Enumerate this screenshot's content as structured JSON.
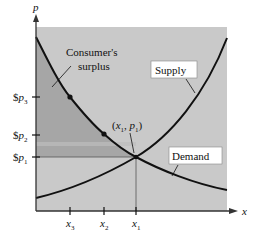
{
  "diagram": {
    "type": "economics supply-demand",
    "axes": {
      "y_label": "p",
      "x_label": "x"
    },
    "y_ticks": [
      {
        "id": "p3",
        "prefix": "$",
        "var": "p",
        "sub": "3",
        "y": 97
      },
      {
        "id": "p2",
        "prefix": "$",
        "var": "p",
        "sub": "2",
        "y": 135
      },
      {
        "id": "p1",
        "prefix": "$",
        "var": "p",
        "sub": "1",
        "y": 157
      }
    ],
    "x_ticks": [
      {
        "id": "x3",
        "var": "x",
        "sub": "3",
        "x": 70
      },
      {
        "id": "x2",
        "var": "x",
        "sub": "2",
        "x": 104
      },
      {
        "id": "x1",
        "var": "x",
        "sub": "1",
        "x": 136
      }
    ],
    "curves": {
      "supply_label": "Supply",
      "demand_label": "Demand"
    },
    "annotations": {
      "consumer_surplus_line1": "Consumer's",
      "consumer_surplus_line2": "surplus",
      "equilibrium_open": "(",
      "equilibrium_x": "x",
      "equilibrium_x_sub": "1",
      "equilibrium_comma": ", ",
      "equilibrium_p": "p",
      "equilibrium_p_sub": "1",
      "equilibrium_close": ")"
    },
    "colors": {
      "plot_background": "#c9c9c9",
      "surplus_fill": "#a6a6a6",
      "curve": "#111111",
      "axis": "#333333"
    }
  }
}
